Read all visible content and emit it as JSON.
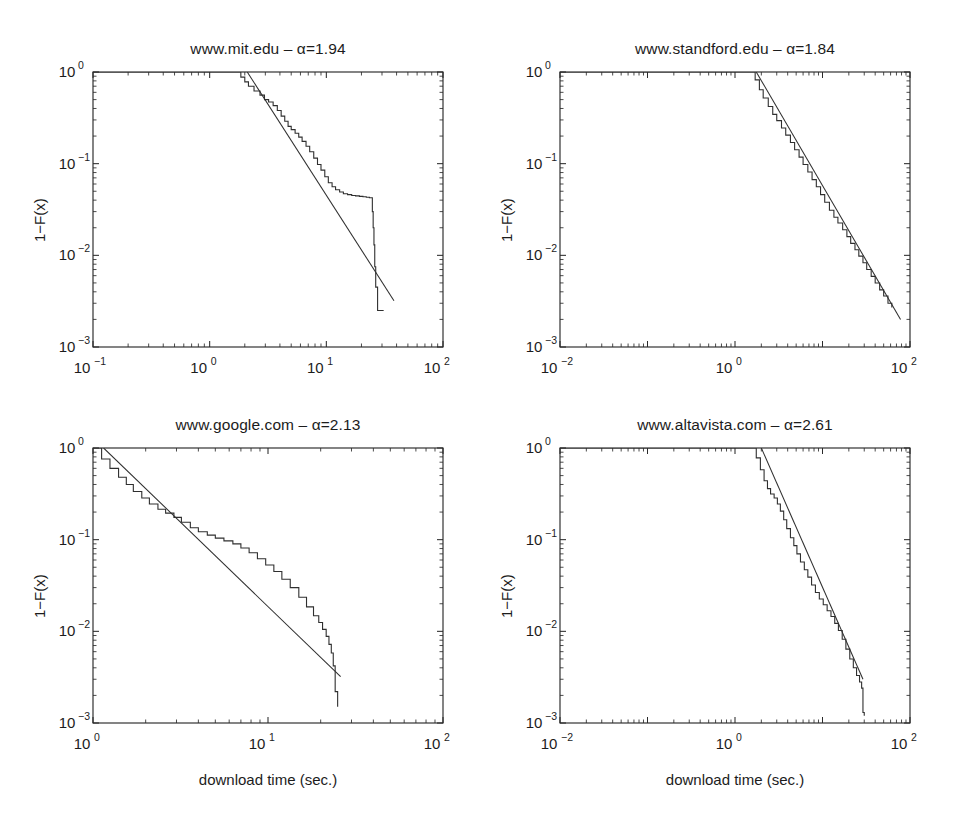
{
  "figure": {
    "axis_label_x": "download time (sec.)",
    "axis_label_y": "1−F(x)",
    "line_color": "#2f2f2f",
    "frame_color": "#2a2a2a"
  },
  "chart_data": [
    {
      "type": "line",
      "panel": "top-left",
      "title": "www.mit.edu – α=1.94",
      "site": "www.mit.edu",
      "alpha": 1.94,
      "xlabel": "download time (sec.)",
      "ylabel": "1−F(x)",
      "xscale": "log",
      "yscale": "log",
      "xlim": [
        0.1,
        100
      ],
      "ylim": [
        0.001,
        1
      ],
      "xticks": [
        0.1,
        1,
        10,
        100
      ],
      "xticklabels": [
        "10^-1",
        "10^0",
        "10^1",
        "10^2"
      ],
      "yticks": [
        1,
        0.1,
        0.01,
        0.001
      ],
      "yticklabels": [
        "10^0",
        "10^-1",
        "10^-2",
        "10^-3"
      ],
      "grid": false,
      "legend": "none",
      "series": [
        {
          "name": "empirical CCDF",
          "style": "step",
          "x": [
            0.1,
            1.6,
            1.85,
            2.0,
            2.15,
            2.4,
            2.7,
            2.95,
            3.2,
            3.5,
            3.8,
            4.1,
            4.4,
            4.7,
            5.0,
            5.4,
            5.8,
            6.2,
            6.7,
            7.2,
            7.8,
            8.4,
            9.0,
            9.7,
            10.4,
            11.2,
            12.0,
            13.0,
            14.0,
            15.2,
            16.5,
            17.8,
            19.2,
            20.6,
            22.0,
            23.4,
            24.2,
            24.8,
            25.2,
            25.6,
            26.0,
            26.5,
            27.5,
            31.0
          ],
          "y": [
            1.0,
            1.0,
            0.88,
            0.78,
            0.7,
            0.62,
            0.56,
            0.5,
            0.47,
            0.43,
            0.38,
            0.33,
            0.29,
            0.255,
            0.235,
            0.215,
            0.195,
            0.175,
            0.155,
            0.135,
            0.115,
            0.098,
            0.085,
            0.072,
            0.062,
            0.056,
            0.052,
            0.049,
            0.047,
            0.046,
            0.045,
            0.0445,
            0.044,
            0.0435,
            0.043,
            0.0425,
            0.0425,
            0.03,
            0.02,
            0.013,
            0.0075,
            0.0045,
            0.0025,
            0.0025
          ]
        },
        {
          "name": "power-law fit",
          "style": "straight",
          "x": [
            2.1,
            38.0
          ],
          "y": [
            1.0,
            0.0032
          ]
        }
      ]
    },
    {
      "type": "line",
      "panel": "top-right",
      "title": "www.standford.edu – α=1.84",
      "site": "www.standford.edu",
      "alpha": 1.84,
      "xlabel": "download time (sec.)",
      "ylabel": "1−F(x)",
      "xscale": "log",
      "yscale": "log",
      "xlim": [
        0.01,
        100
      ],
      "ylim": [
        0.001,
        1
      ],
      "xticks": [
        0.01,
        1,
        100
      ],
      "xticklabels": [
        "10^-2",
        "10^0",
        "10^2"
      ],
      "yticks": [
        1,
        0.1,
        0.01,
        0.001
      ],
      "yticklabels": [
        "10^0",
        "10^-1",
        "10^-2",
        "10^-3"
      ],
      "grid": false,
      "legend": "none",
      "series": [
        {
          "name": "empirical CCDF",
          "style": "step",
          "x": [
            0.01,
            1.5,
            1.7,
            1.9,
            2.1,
            2.4,
            2.7,
            3.0,
            3.4,
            3.8,
            4.3,
            4.8,
            5.4,
            6.0,
            6.8,
            7.6,
            8.5,
            9.5,
            10.6,
            12.0,
            13.5,
            15.0,
            17.0,
            19.0,
            21.0,
            23.5,
            26.0,
            29.0,
            32.0,
            36.0,
            40.0,
            45.0,
            50.0,
            56.0,
            62.0
          ],
          "y": [
            1.0,
            1.0,
            0.82,
            0.64,
            0.52,
            0.42,
            0.345,
            0.295,
            0.245,
            0.205,
            0.17,
            0.142,
            0.118,
            0.098,
            0.081,
            0.067,
            0.056,
            0.046,
            0.038,
            0.031,
            0.026,
            0.0225,
            0.019,
            0.016,
            0.0135,
            0.0115,
            0.0098,
            0.0083,
            0.007,
            0.0059,
            0.005,
            0.0042,
            0.0036,
            0.003,
            0.0027
          ]
        },
        {
          "name": "power-law fit",
          "style": "straight",
          "x": [
            1.75,
            78.0
          ],
          "y": [
            1.0,
            0.002
          ]
        }
      ]
    },
    {
      "type": "line",
      "panel": "bottom-left",
      "title": "www.google.com – α=2.13",
      "site": "www.google.com",
      "alpha": 2.13,
      "xlabel": "download time (sec.)",
      "ylabel": "1−F(x)",
      "xscale": "log",
      "yscale": "log",
      "xlim": [
        1,
        100
      ],
      "ylim": [
        0.001,
        1
      ],
      "xticks": [
        1,
        10,
        100
      ],
      "xticklabels": [
        "10^0",
        "10^1",
        "10^2"
      ],
      "yticks": [
        1,
        0.1,
        0.01,
        0.001
      ],
      "yticklabels": [
        "10^0",
        "10^-1",
        "10^-2",
        "10^-3"
      ],
      "grid": false,
      "legend": "none",
      "series": [
        {
          "name": "empirical CCDF",
          "style": "step",
          "x": [
            1.0,
            1.12,
            1.25,
            1.4,
            1.55,
            1.7,
            1.9,
            2.1,
            2.35,
            2.6,
            2.9,
            3.2,
            3.6,
            4.0,
            4.5,
            5.0,
            5.6,
            6.3,
            7.0,
            7.8,
            8.7,
            9.7,
            10.8,
            12.0,
            13.4,
            15.0,
            16.6,
            18.2,
            19.5,
            20.5,
            21.5,
            22.3,
            23.0,
            23.6,
            24.2,
            25.0
          ],
          "y": [
            1.0,
            0.76,
            0.6,
            0.48,
            0.4,
            0.335,
            0.285,
            0.245,
            0.215,
            0.195,
            0.175,
            0.155,
            0.135,
            0.122,
            0.112,
            0.104,
            0.097,
            0.09,
            0.081,
            0.072,
            0.062,
            0.053,
            0.045,
            0.037,
            0.03,
            0.0235,
            0.0185,
            0.0148,
            0.0125,
            0.0105,
            0.0088,
            0.0072,
            0.0058,
            0.0042,
            0.0022,
            0.0015
          ]
        },
        {
          "name": "power-law fit",
          "style": "straight",
          "x": [
            1.15,
            26.0
          ],
          "y": [
            1.0,
            0.0032
          ]
        }
      ]
    },
    {
      "type": "line",
      "panel": "bottom-right",
      "title": "www.altavista.com – α=2.61",
      "site": "www.altavista.com",
      "alpha": 2.61,
      "xlabel": "download time (sec.)",
      "ylabel": "1−F(x)",
      "xscale": "log",
      "yscale": "log",
      "xlim": [
        0.01,
        100
      ],
      "ylim": [
        0.001,
        1
      ],
      "xticks": [
        0.01,
        1,
        100
      ],
      "xticklabels": [
        "10^-2",
        "10^0",
        "10^2"
      ],
      "yticks": [
        1,
        0.1,
        0.01,
        0.001
      ],
      "yticklabels": [
        "10^0",
        "10^-1",
        "10^-2",
        "10^-3"
      ],
      "grid": false,
      "legend": "none",
      "series": [
        {
          "name": "empirical CCDF",
          "style": "step",
          "x": [
            0.01,
            1.55,
            1.75,
            1.95,
            2.15,
            2.35,
            2.55,
            2.8,
            3.05,
            3.3,
            3.6,
            3.9,
            4.3,
            4.7,
            5.1,
            5.6,
            6.2,
            6.8,
            7.5,
            8.3,
            9.2,
            10.2,
            11.3,
            12.5,
            13.8,
            15.2,
            16.8,
            18.5,
            20.5,
            22.5,
            24.5,
            26.5,
            28.0,
            29.0,
            30.0
          ],
          "y": [
            1.0,
            1.0,
            0.78,
            0.58,
            0.44,
            0.36,
            0.315,
            0.285,
            0.245,
            0.205,
            0.165,
            0.132,
            0.105,
            0.086,
            0.07,
            0.057,
            0.047,
            0.039,
            0.032,
            0.0265,
            0.0225,
            0.0195,
            0.0168,
            0.0145,
            0.0122,
            0.0102,
            0.0082,
            0.0064,
            0.005,
            0.004,
            0.0033,
            0.0028,
            0.0024,
            0.0013,
            0.0012
          ]
        },
        {
          "name": "power-law fit",
          "style": "straight",
          "x": [
            2.0,
            29.0
          ],
          "y": [
            1.0,
            0.003
          ]
        }
      ]
    }
  ]
}
